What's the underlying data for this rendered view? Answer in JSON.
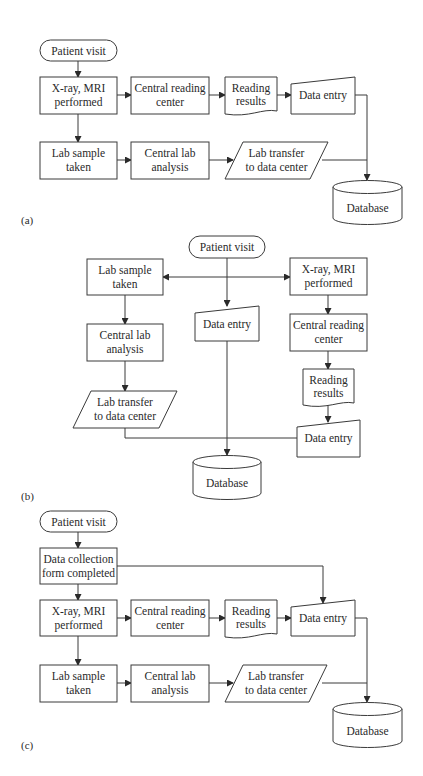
{
  "figure": {
    "panels": [
      {
        "label": "(a)",
        "nodes": {
          "patient_visit": "Patient visit",
          "xray": [
            "X-ray, MRI",
            "performed"
          ],
          "central_reading": [
            "Central reading",
            "center"
          ],
          "reading_results": [
            "Reading",
            "results"
          ],
          "data_entry": "Data entry",
          "lab_sample": [
            "Lab sample",
            "taken"
          ],
          "central_lab": [
            "Central lab",
            "analysis"
          ],
          "lab_transfer": [
            "Lab transfer",
            "to data center"
          ],
          "database": "Database"
        }
      },
      {
        "label": "(b)",
        "nodes": {
          "patient_visit": "Patient visit",
          "lab_sample": [
            "Lab sample",
            "taken"
          ],
          "xray": [
            "X-ray, MRI",
            "performed"
          ],
          "data_entry_center": "Data entry",
          "central_lab": [
            "Central lab",
            "analysis"
          ],
          "central_reading": [
            "Central reading",
            "center"
          ],
          "reading_results": [
            "Reading",
            "results"
          ],
          "lab_transfer": [
            "Lab transfer",
            "to data center"
          ],
          "data_entry_right": "Data entry",
          "database": "Database"
        }
      },
      {
        "label": "(c)",
        "nodes": {
          "patient_visit": "Patient visit",
          "data_collection": [
            "Data collection",
            "form completed"
          ],
          "xray": [
            "X-ray, MRI",
            "performed"
          ],
          "central_reading": [
            "Central reading",
            "center"
          ],
          "reading_results": [
            "Reading",
            "results"
          ],
          "data_entry": "Data entry",
          "lab_sample": [
            "Lab sample",
            "taken"
          ],
          "central_lab": [
            "Central lab",
            "analysis"
          ],
          "lab_transfer": [
            "Lab transfer",
            "to data center"
          ],
          "database": "Database"
        }
      }
    ]
  }
}
